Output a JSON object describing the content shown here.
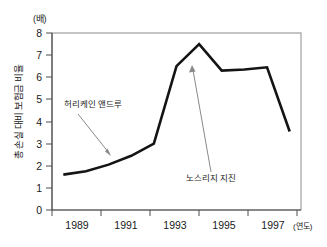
{
  "chart_data": {
    "type": "line",
    "title": "",
    "subtitle": "",
    "unit_label": "(배)",
    "ylabel": "총 손실 대비 보험금 비율",
    "xlabel": "(연도)",
    "x": [
      1988,
      1989,
      1990,
      1991,
      1992,
      1993,
      1994,
      1995,
      1996,
      1997,
      1998
    ],
    "values": [
      1.6,
      1.75,
      2.05,
      2.45,
      3.0,
      6.5,
      7.5,
      6.3,
      6.35,
      6.45,
      3.55
    ],
    "x_tick_labels": [
      "1989",
      "1991",
      "1993",
      "1995",
      "1997"
    ],
    "x_tick_values": [
      1989,
      1991,
      1993,
      1995,
      1997
    ],
    "y_tick_labels": [
      "0",
      "1",
      "2",
      "3",
      "4",
      "5",
      "6",
      "7",
      "8"
    ],
    "y_tick_values": [
      0,
      1,
      2,
      3,
      4,
      5,
      6,
      7,
      8
    ],
    "xlim": [
      1987.5,
      1998.5
    ],
    "ylim": [
      0,
      8
    ],
    "grid": false,
    "legend": "none",
    "line_color": "#141414",
    "line_width": 2.6,
    "annotations": [
      {
        "id": "hurricane-andrew",
        "label": "허리케인 앤드루",
        "text_x": 64,
        "text_y": 107,
        "arrow_from_x": 78,
        "arrow_from_y": 114,
        "arrow_to_x": 111,
        "arrow_to_y": 156,
        "color": "#8a8a8a"
      },
      {
        "id": "northridge-earthquake",
        "label": "노스리지 지진",
        "text_x": 186,
        "text_y": 181,
        "arrow_from_x": 211,
        "arrow_from_y": 172,
        "arrow_to_x": 192,
        "arrow_to_y": 66,
        "color": "#8a8a8a"
      }
    ]
  },
  "axes": {
    "frame_color": "#7a7a7a",
    "axis_color": "#555555",
    "background": "#ffffff"
  }
}
